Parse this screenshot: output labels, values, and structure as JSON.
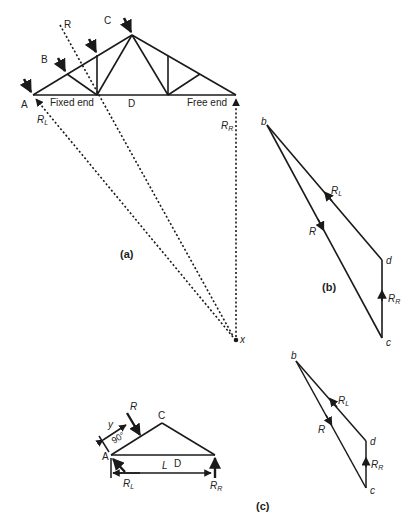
{
  "figure": {
    "panels": {
      "a": {
        "caption": "(a)",
        "labels": {
          "A": "A",
          "B": "B",
          "C": "C",
          "D": "D",
          "R": "R",
          "fixed_end": "Fixed end",
          "free_end": "Free end",
          "RL_main": "R",
          "RL_sub": "L",
          "RR_main": "R",
          "RR_sub": "R",
          "x": "x"
        }
      },
      "b": {
        "caption": "(b)",
        "labels": {
          "b": "b",
          "c": "c",
          "d": "d",
          "R": "R",
          "RL_main": "R",
          "RL_sub": "L",
          "RR_main": "R",
          "RR_sub": "R"
        }
      },
      "c": {
        "caption": "(c)",
        "labels": {
          "A": "A",
          "C": "C",
          "D": "D",
          "L": "L",
          "y": "y",
          "angle": "90°",
          "R": "R",
          "RL_main": "R",
          "RL_sub": "L",
          "RR_main": "R",
          "RR_sub": "R",
          "b": "b",
          "c": "c",
          "d": "d",
          "poly_R": "R",
          "poly_RL_main": "R",
          "poly_RL_sub": "L",
          "poly_RR_main": "R",
          "poly_RR_sub": "R"
        }
      }
    },
    "colors": {
      "line": "#1a1a1a",
      "text": "#222222",
      "background": "#ffffff"
    }
  }
}
